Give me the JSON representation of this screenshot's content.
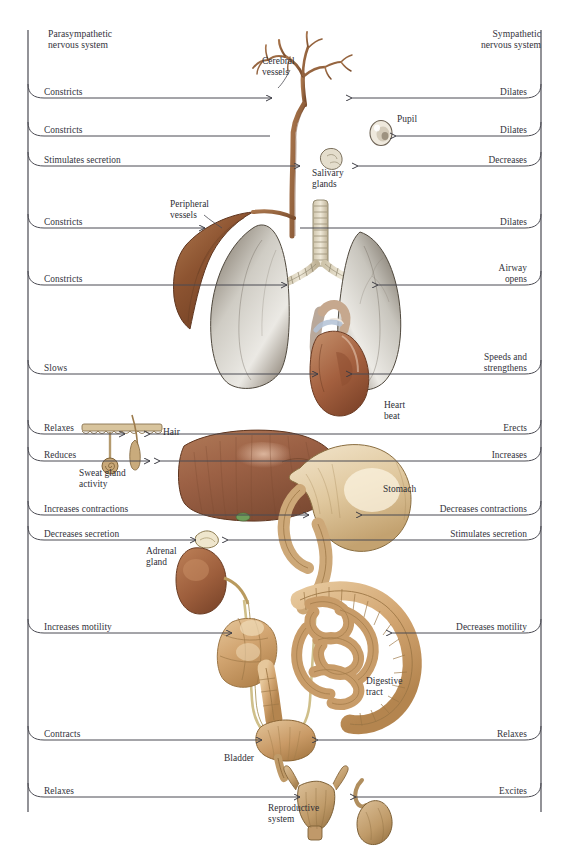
{
  "figure": {
    "title_left": "Parasympathetic\nnervous system",
    "title_right": "Sympathetic\nnervous system"
  },
  "colors": {
    "line": "#4a4a52",
    "text": "#33333c",
    "liver": "#9c6145",
    "liver_dark": "#764staff",
    "stomach": "#e3cfa8",
    "intestine": "#d2a571",
    "intestine_dark": "#a87a49",
    "lung": "#d9d6d0",
    "lung_shade": "#6b6257",
    "heart": "#a4603f",
    "vessel": "#8a5a3a",
    "kidney": "#a4603f",
    "bladder": "#c99a66",
    "repro": "#c4a077",
    "background": "#ffffff"
  },
  "rows": [
    {
      "left": "Constricts",
      "right": "Dilates",
      "y": 98,
      "organ": "cerebral-vessels"
    },
    {
      "left": "Constricts",
      "right": "Dilates",
      "y": 136,
      "organ": "pupil"
    },
    {
      "left": "Stimulates secretion",
      "right": "Decreases",
      "y": 166,
      "organ": "salivary-glands"
    },
    {
      "left": "Constricts",
      "right": "Dilates",
      "y": 228,
      "organ": "peripheral-vessels"
    },
    {
      "left": "Constricts",
      "right": "Airway\nopens",
      "y": 285,
      "organ": "airway"
    },
    {
      "left": "Slows",
      "right": "Speeds and\nstrengthens",
      "y": 374,
      "organ": "heart"
    },
    {
      "left": "Relaxes",
      "right": "Erects",
      "y": 434,
      "organ": "hair"
    },
    {
      "left": "Reduces",
      "right": "Increases",
      "y": 461,
      "organ": "sweat-gland"
    },
    {
      "left": "Increases contractions",
      "right": "Decreases contractions",
      "y": 515,
      "organ": "stomach"
    },
    {
      "left": "Decreases secretion",
      "right": "Stimulates secretion",
      "y": 540,
      "organ": "adrenal-gland"
    },
    {
      "left": "Increases motility",
      "right": "Decreases motility",
      "y": 633,
      "organ": "digestive-tract"
    },
    {
      "left": "Contracts",
      "right": "Relaxes",
      "y": 740,
      "organ": "bladder"
    },
    {
      "left": "Relaxes",
      "right": "Excites",
      "y": 797,
      "organ": "reproductive-system"
    }
  ],
  "organ_labels": [
    {
      "name": "cerebral-vessels",
      "text": "Cerebral\nvessels",
      "x": 262,
      "y": 56,
      "align": "left"
    },
    {
      "name": "pupil",
      "text": "Pupil",
      "x": 397,
      "y": 114,
      "align": "left"
    },
    {
      "name": "salivary-glands",
      "text": "Salivary\nglands",
      "x": 312,
      "y": 168,
      "align": "left"
    },
    {
      "name": "peripheral-vessels",
      "text": "Peripheral\nvessels",
      "x": 170,
      "y": 199,
      "align": "left"
    },
    {
      "name": "heart-beat",
      "text": "Heart\nbeat",
      "x": 384,
      "y": 400,
      "align": "left"
    },
    {
      "name": "hair",
      "text": "Hair",
      "x": 163,
      "y": 427,
      "align": "left"
    },
    {
      "name": "sweat-gland",
      "text": "Sweat gland\nactivity",
      "x": 79,
      "y": 468,
      "align": "left"
    },
    {
      "name": "stomach",
      "text": "Stomach",
      "x": 383,
      "y": 484,
      "align": "left"
    },
    {
      "name": "adrenal-gland",
      "text": "Adrenal\ngland",
      "x": 146,
      "y": 546,
      "align": "left"
    },
    {
      "name": "digestive-tract",
      "text": "Digestive\ntract",
      "x": 366,
      "y": 676,
      "align": "left"
    },
    {
      "name": "bladder",
      "text": "Bladder",
      "x": 224,
      "y": 753,
      "align": "left"
    },
    {
      "name": "reproductive-system",
      "text": "Reproductive\nsystem",
      "x": 268,
      "y": 803,
      "align": "left"
    }
  ],
  "spine": {
    "left_x": 28,
    "right_x": 541,
    "top_y": 30,
    "bottom_y": 812
  }
}
